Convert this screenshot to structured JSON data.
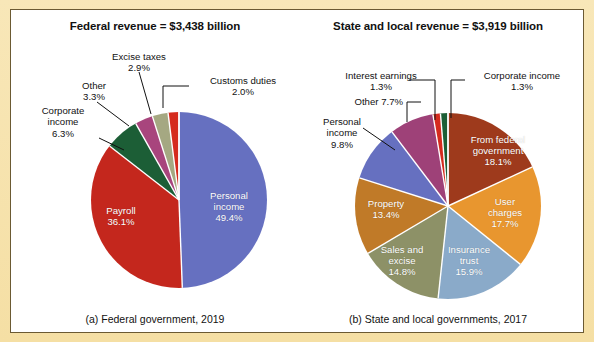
{
  "figure": {
    "background_color": "#f7e3ae",
    "panel_color": "#ffffff",
    "border_color": "#6b5a33"
  },
  "charts": {
    "a": {
      "title": "Federal revenue  =  $3,438 billion",
      "caption": "(a) Federal government, 2019",
      "center": {
        "x": 168,
        "y": 190
      },
      "radius": 88,
      "start_angle_deg": -90
    },
    "b": {
      "title": "State and local revenue  =  $3,919 billion",
      "caption": "(b) State and local governments, 2017",
      "center": {
        "x": 437,
        "y": 196
      },
      "radius": 93,
      "start_angle_deg": -90
    }
  },
  "chart_data": [
    {
      "type": "pie",
      "id": "federal-revenue",
      "title": "Federal revenue = $3,438 billion",
      "subtitle": "(a) Federal government, 2019",
      "total_label": "$3,438 billion",
      "total_value": 3438,
      "units": "billion dollars",
      "year": 2019,
      "categories": [
        "Personal income",
        "Payroll",
        "Corporate income",
        "Other",
        "Excise taxes",
        "Customs duties"
      ],
      "values": [
        49.4,
        36.1,
        6.3,
        3.3,
        2.9,
        2.0
      ],
      "value_labels": [
        "49.4%",
        "36.1%",
        "6.3%",
        "3.3%",
        "2.9%",
        "2.0%"
      ],
      "colors": [
        "#6670c0",
        "#c4271d",
        "#1c5e36",
        "#a8457d",
        "#a5a882",
        "#d52b1e"
      ],
      "label_placement": [
        "inside",
        "inside",
        "outside",
        "outside",
        "outside",
        "outside"
      ],
      "legend": "none",
      "grid": false
    },
    {
      "type": "pie",
      "id": "state-and-local-revenue",
      "title": "State and local revenue = $3,919 billion",
      "subtitle": "(b) State and local governments, 2017",
      "total_label": "$3,919 billion",
      "total_value": 3919,
      "units": "billion dollars",
      "year": 2017,
      "categories": [
        "From federal government",
        "User charges",
        "Insurance trust",
        "Sales and excise",
        "Property",
        "Personal income",
        "Other",
        "Interest earnings",
        "Corporate income"
      ],
      "values": [
        18.1,
        17.7,
        15.9,
        14.8,
        13.4,
        9.8,
        7.7,
        1.3,
        1.3
      ],
      "value_labels": [
        "18.1%",
        "17.7%",
        "15.9%",
        "14.8%",
        "13.4%",
        "9.8%",
        "7.7%",
        "1.3%",
        "1.3%"
      ],
      "colors": [
        "#9e3a1c",
        "#e8962f",
        "#8aaac9",
        "#8d9167",
        "#c07a28",
        "#6670c0",
        "#9e4178",
        "#d52b1e",
        "#1c5e36"
      ],
      "label_placement": [
        "inside",
        "inside",
        "inside",
        "inside",
        "inside",
        "outside",
        "outside",
        "outside",
        "outside"
      ],
      "legend": "none",
      "grid": false
    }
  ],
  "labels_a": {
    "corporate_income": {
      "name": "Corporate income",
      "line1": "Corporate",
      "line2": "income",
      "pct": "6.3%"
    },
    "other": {
      "name": "Other",
      "line1": "Other",
      "pct": "3.3%"
    },
    "excise_taxes": {
      "name": "Excise taxes",
      "line1": "Excise taxes",
      "pct": "2.9%"
    },
    "customs_duties": {
      "name": "Customs duties",
      "line1": "Customs duties",
      "pct": "2.0%"
    },
    "payroll": {
      "line1": "Payroll",
      "pct": "36.1%"
    },
    "personal_income": {
      "line1": "Personal",
      "line2": "income",
      "pct": "49.4%"
    }
  },
  "labels_b": {
    "interest_earnings": {
      "line1": "Interest earnings",
      "pct": "1.3%"
    },
    "corporate_income": {
      "line1": "Corporate income",
      "pct": "1.3%"
    },
    "other": {
      "line1": "Other 7.7%"
    },
    "personal_income": {
      "line1": "Personal",
      "line2": "income",
      "pct": "9.8%"
    },
    "from_federal": {
      "line1": "From federal",
      "line2": "government",
      "pct": "18.1%"
    },
    "user_charges": {
      "line1": "User",
      "line2": "charges",
      "pct": "17.7%"
    },
    "insurance_trust": {
      "line1": "Insurance",
      "line2": "trust",
      "pct": "15.9%"
    },
    "sales_and_excise": {
      "line1": "Sales and",
      "line2": "excise",
      "pct": "14.8%"
    },
    "property": {
      "line1": "Property",
      "pct": "13.4%"
    }
  }
}
